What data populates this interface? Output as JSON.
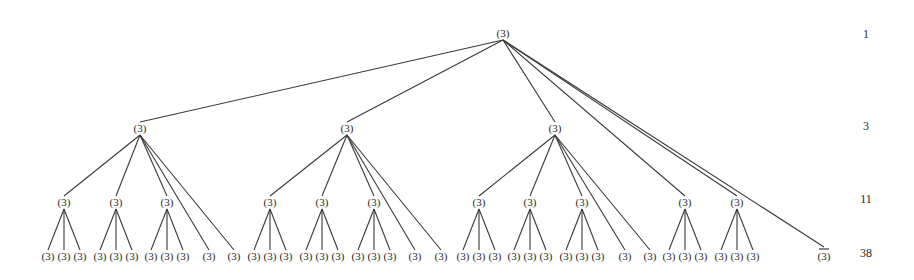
{
  "diagram": {
    "type": "tree",
    "node_label": "(3)",
    "special_leaf_label": "(3)",
    "special_leaf_overbar": true,
    "level_counts": [
      {
        "level": 1,
        "count": "1",
        "y": 38
      },
      {
        "level": 2,
        "count": "3",
        "y": 130
      },
      {
        "level": 3,
        "count": "11",
        "y": 203
      },
      {
        "level": 4,
        "count": "38",
        "y": 257
      }
    ],
    "level_y": {
      "root": 37,
      "l2": 132,
      "l3": 206,
      "leaf": 260
    },
    "nodes": {
      "root": {
        "id": "root",
        "x": 503,
        "label": "(3)"
      },
      "l2": [
        {
          "id": "A",
          "x": 140,
          "label": "(3)"
        },
        {
          "id": "B",
          "x": 347,
          "label": "(3)"
        },
        {
          "id": "C",
          "x": 555,
          "label": "(3)"
        }
      ],
      "l3": [
        {
          "id": "A1",
          "parent": "A",
          "x": 64,
          "label": "(3)"
        },
        {
          "id": "A2",
          "parent": "A",
          "x": 116,
          "label": "(3)"
        },
        {
          "id": "A3",
          "parent": "A",
          "x": 167,
          "label": "(3)"
        },
        {
          "id": "B1",
          "parent": "B",
          "x": 270,
          "label": "(3)"
        },
        {
          "id": "B2",
          "parent": "B",
          "x": 322,
          "label": "(3)"
        },
        {
          "id": "B3",
          "parent": "B",
          "x": 374,
          "label": "(3)"
        },
        {
          "id": "C1",
          "parent": "C",
          "x": 479,
          "label": "(3)"
        },
        {
          "id": "C2",
          "parent": "C",
          "x": 530,
          "label": "(3)"
        },
        {
          "id": "C3",
          "parent": "C",
          "x": 582,
          "label": "(3)"
        },
        {
          "id": "R1",
          "parent": "root",
          "x": 685,
          "label": "(3)"
        },
        {
          "id": "R2",
          "parent": "root",
          "x": 737,
          "label": "(3)"
        }
      ],
      "leaves": [
        {
          "parent": "A1",
          "x": 48,
          "label": "(3)"
        },
        {
          "parent": "A1",
          "x": 64,
          "label": "(3)"
        },
        {
          "parent": "A1",
          "x": 80,
          "label": "(3)"
        },
        {
          "parent": "A2",
          "x": 100,
          "label": "(3)"
        },
        {
          "parent": "A2",
          "x": 116,
          "label": "(3)"
        },
        {
          "parent": "A2",
          "x": 132,
          "label": "(3)"
        },
        {
          "parent": "A3",
          "x": 151,
          "label": "(3)"
        },
        {
          "parent": "A3",
          "x": 167,
          "label": "(3)"
        },
        {
          "parent": "A3",
          "x": 183,
          "label": "(3)"
        },
        {
          "parent": "A",
          "x": 209,
          "label": "(3)"
        },
        {
          "parent": "A",
          "x": 234,
          "label": "(3)"
        },
        {
          "parent": "B1",
          "x": 254,
          "label": "(3)"
        },
        {
          "parent": "B1",
          "x": 270,
          "label": "(3)"
        },
        {
          "parent": "B1",
          "x": 286,
          "label": "(3)"
        },
        {
          "parent": "B2",
          "x": 306,
          "label": "(3)"
        },
        {
          "parent": "B2",
          "x": 322,
          "label": "(3)"
        },
        {
          "parent": "B2",
          "x": 338,
          "label": "(3)"
        },
        {
          "parent": "B3",
          "x": 358,
          "label": "(3)"
        },
        {
          "parent": "B3",
          "x": 374,
          "label": "(3)"
        },
        {
          "parent": "B3",
          "x": 390,
          "label": "(3)"
        },
        {
          "parent": "B",
          "x": 415,
          "label": "(3)"
        },
        {
          "parent": "B",
          "x": 441,
          "label": "(3)"
        },
        {
          "parent": "C1",
          "x": 463,
          "label": "(3)"
        },
        {
          "parent": "C1",
          "x": 479,
          "label": "(3)"
        },
        {
          "parent": "C1",
          "x": 495,
          "label": "(3)"
        },
        {
          "parent": "C2",
          "x": 514,
          "label": "(3)"
        },
        {
          "parent": "C2",
          "x": 530,
          "label": "(3)"
        },
        {
          "parent": "C2",
          "x": 546,
          "label": "(3)"
        },
        {
          "parent": "C3",
          "x": 566,
          "label": "(3)"
        },
        {
          "parent": "C3",
          "x": 582,
          "label": "(3)"
        },
        {
          "parent": "C3",
          "x": 598,
          "label": "(3)"
        },
        {
          "parent": "C",
          "x": 625,
          "label": "(3)"
        },
        {
          "parent": "C",
          "x": 650,
          "label": "(3)"
        },
        {
          "parent": "R1",
          "x": 669,
          "label": "(3)"
        },
        {
          "parent": "R1",
          "x": 685,
          "label": "(3)"
        },
        {
          "parent": "R1",
          "x": 701,
          "label": "(3)"
        },
        {
          "parent": "R2",
          "x": 721,
          "label": "(3)"
        },
        {
          "parent": "R2",
          "x": 737,
          "label": "(3)"
        },
        {
          "parent": "R2",
          "x": 753,
          "label": "(3)"
        },
        {
          "parent": "root",
          "x": 824,
          "label": "(3)",
          "overbar": true
        }
      ]
    },
    "counts_column_x": 866
  }
}
